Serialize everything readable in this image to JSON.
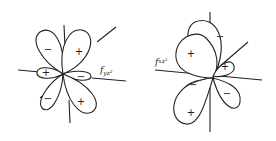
{
  "diagram": {
    "orbitals": [
      {
        "label": "f",
        "subscript": "yz²",
        "signs": [
          "−",
          "+",
          "+",
          "−",
          "−",
          "+"
        ]
      },
      {
        "label": "f",
        "subscript": "xz²",
        "signs": [
          "−",
          "+",
          "+",
          "−",
          "−",
          "+"
        ]
      }
    ]
  }
}
